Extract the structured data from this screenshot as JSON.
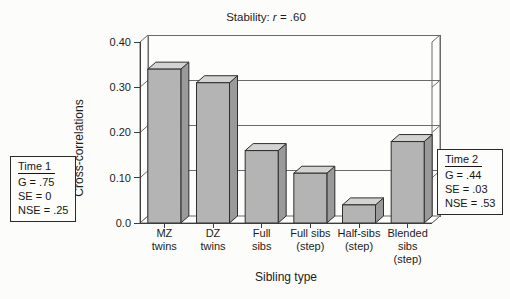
{
  "chart_data": {
    "type": "bar",
    "style_3d": true,
    "title": "Stability: r = .60",
    "title_parts": {
      "prefix": "Stability: ",
      "italic_var": "r",
      "suffix": " = .60"
    },
    "xlabel": "Sibling type",
    "ylabel": "Cross-correlations",
    "categories": [
      "MZ\ntwins",
      "DZ\ntwins",
      "Full\nsibs",
      "Full sibs\n(step)",
      "Half-sibs\n(step)",
      "Blended\nsibs\n(step)"
    ],
    "values": [
      0.34,
      0.31,
      0.16,
      0.11,
      0.04,
      0.18
    ],
    "ylim": [
      0,
      0.4
    ],
    "yticks": [
      0,
      0.1,
      0.2,
      0.3,
      0.4
    ],
    "ytick_labels": [
      "0.0",
      "0.10",
      "0.20",
      "0.30",
      "0.40"
    ],
    "grid": true,
    "legend": "none",
    "colors": {
      "bar_front": "#b4b4b4",
      "bar_top": "#d3d3d3",
      "bar_side": "#9a9a9a",
      "bar_outline": "#2e2e2e",
      "frame": "#6b6b6b",
      "gridline": "#6b6b6b",
      "axis": "#3c3c3c",
      "wall": "#fdfdfb",
      "text": "#1c1c1c"
    }
  },
  "annotations": {
    "time1_box": {
      "title": "Time 1",
      "lines": [
        "G = .75",
        "SE = 0",
        "NSE = .25"
      ]
    },
    "time2_box": {
      "title": "Time 2",
      "lines": [
        "G = .44",
        "SE = .03",
        "NSE = .53"
      ]
    }
  }
}
